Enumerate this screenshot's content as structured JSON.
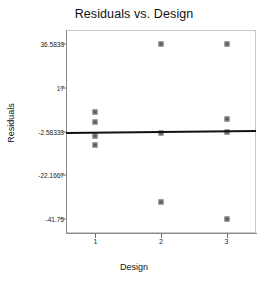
{
  "chart_data": {
    "type": "scatter",
    "title": "Residuals vs. Design",
    "xlabel": "Design",
    "ylabel": "Residuals",
    "grid": false,
    "legend": null,
    "xlim": [
      0.55,
      3.45
    ],
    "ylim": [
      -48.0,
      43.0
    ],
    "xticks": [
      "1",
      "2",
      "3"
    ],
    "xtick_values": [
      1,
      2,
      3
    ],
    "yticks": [
      "36.5833",
      "17",
      "-2.58333",
      "-22.1667",
      "-41.75"
    ],
    "ytick_values": [
      36.5833,
      17,
      -2.58333,
      -22.1667,
      -41.75
    ],
    "reference_line": {
      "label": "residual reference line",
      "y_left": -2.9,
      "y_right": -2.0
    },
    "points": [
      {
        "x": 1,
        "y": 6.3
      },
      {
        "x": 1,
        "y": 1.8
      },
      {
        "x": 1,
        "y": -4.5
      },
      {
        "x": 1,
        "y": -8.4
      },
      {
        "x": 2,
        "y": 36.5833
      },
      {
        "x": 2,
        "y": -3.1
      },
      {
        "x": 2,
        "y": -34.1
      },
      {
        "x": 3,
        "y": 36.5833
      },
      {
        "x": 3,
        "y": 2.9
      },
      {
        "x": 3,
        "y": -2.6
      },
      {
        "x": 3,
        "y": -41.75
      }
    ],
    "series": [
      {
        "name": "Residuals",
        "x": [
          1,
          1,
          1,
          1,
          2,
          2,
          2,
          3,
          3,
          3,
          3
        ],
        "values": [
          6.3,
          1.8,
          -4.5,
          -8.4,
          36.5833,
          -3.1,
          -34.1,
          36.5833,
          2.9,
          -2.6,
          -41.75
        ]
      }
    ],
    "colors": {
      "marker": "#5a5a5a",
      "marker_edge": "#8f8f8f",
      "reference_line": "#111111",
      "frame": "#c9c9c9",
      "background": "#ffffff"
    }
  }
}
